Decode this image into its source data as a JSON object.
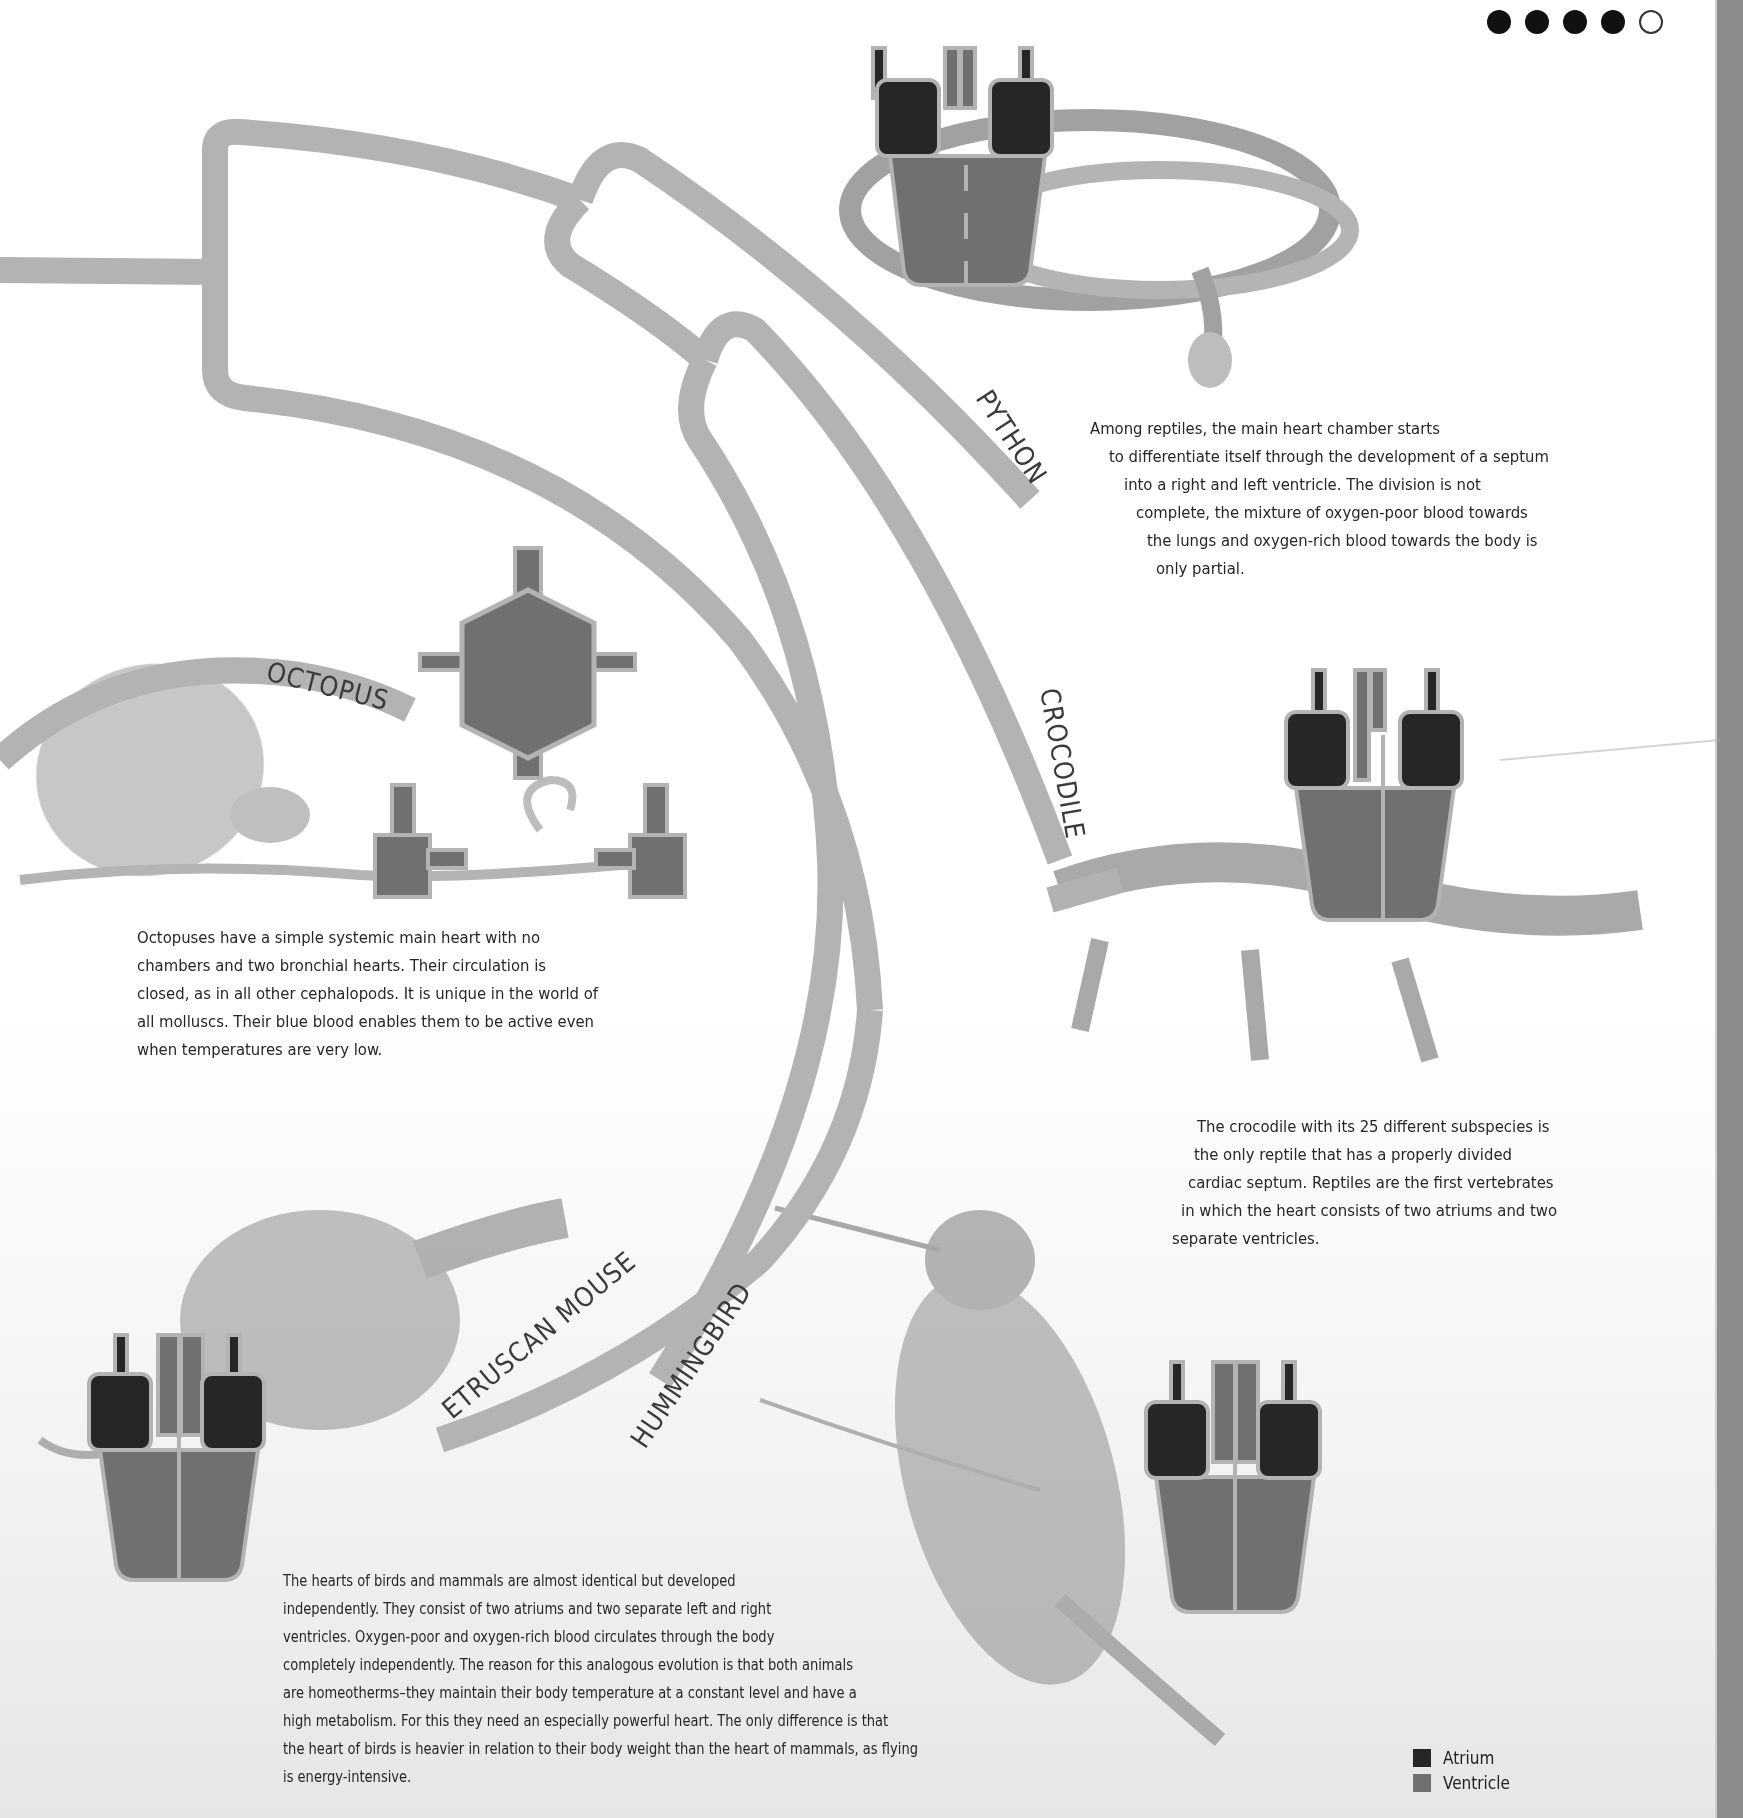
{
  "pagination": {
    "dots": [
      {
        "state": "filled"
      },
      {
        "state": "filled"
      },
      {
        "state": "filled"
      },
      {
        "state": "filled"
      },
      {
        "state": "empty"
      }
    ]
  },
  "colors": {
    "atrium": "#262626",
    "ventricle": "#6e6e6e",
    "outline": "#b3b3b3",
    "branch": "#b3b3b3",
    "page_edge": "#8c8c8c"
  },
  "tree": {
    "labels": {
      "python": "PYTHON",
      "crocodile": "CROCODILE",
      "octopus": "OCTOPUS",
      "etruscan_mouse": "ETRUSCAN MOUSE",
      "hummingbird": "HUMMINGBIRD"
    }
  },
  "texts": {
    "python": [
      "Among reptiles, the main heart chamber starts",
      "to differentiate itself through the development of a septum",
      "into a right and left ventricle. The division is not",
      "complete, the mixture of oxygen-poor blood towards",
      "the lungs and oxygen-rich blood towards the body is",
      "only partial."
    ],
    "octopus": [
      "Octopuses have a simple systemic main heart with no",
      "chambers and two bronchial hearts. Their circulation is",
      "closed, as in all other cephalopods. It is unique in the world of",
      "all molluscs. Their blue blood enables them to be active even",
      "when temperatures are very low."
    ],
    "crocodile": [
      "The crocodile with its 25 different subspecies is",
      "the only reptile that has a properly divided",
      "cardiac septum. Reptiles are the first vertebrates",
      "in which the heart consists of two atriums and two",
      "separate ventricles."
    ],
    "birds_mammals": [
      "The hearts of birds and mammals are almost identical but developed",
      "independently. They consist of two atriums and two separate left and right",
      "ventricles. Oxygen-poor and oxygen-rich blood circulates through the body",
      "completely independently. The reason for this analogous evolution is that both animals",
      "are homeotherms–they maintain their body temperature at a constant level and have a",
      "high metabolism. For this they need an especially powerful heart. The only difference is that",
      "the heart of birds is heavier in relation to their body weight than the heart of mammals, as flying",
      "is energy-intensive."
    ]
  },
  "legend": {
    "items": [
      {
        "label": "Atrium",
        "color": "#262626"
      },
      {
        "label": "Ventricle",
        "color": "#707070"
      }
    ]
  },
  "illustrations": {
    "python": "python-sketch",
    "crocodile": "crocodile-sketch",
    "octopus": "octopus-sketch",
    "etruscan_mouse": "shrew-sketch",
    "hummingbird": "hummingbird-sketch"
  }
}
